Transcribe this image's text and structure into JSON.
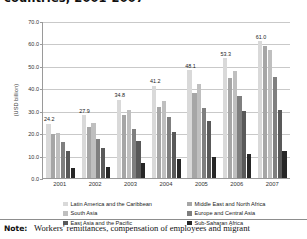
{
  "title": "countries, 2001-2007",
  "chart_data": {
    "type": "bar",
    "title": "countries, 2001-2007",
    "xlabel": "",
    "ylabel": "(USD billion)",
    "ylim": [
      0,
      70
    ],
    "ytick_step": 10,
    "yticks": [
      "0.0",
      "10.0",
      "20.0",
      "30.0",
      "40.0",
      "50.0",
      "60.0",
      "70.0"
    ],
    "grid": true,
    "legend_position": "bottom",
    "categories": [
      "2001",
      "2002",
      "2003",
      "2004",
      "2005",
      "2006",
      "2007"
    ],
    "series": [
      {
        "name": "Latin America and the Caribbean",
        "color": "#d9d9d9",
        "values": [
          24.2,
          27.9,
          34.8,
          41.2,
          48.1,
          53.3,
          61.0
        ],
        "labels": [
          "24.2",
          "27.9",
          "34.8",
          "41.2",
          "48.1",
          "53.3",
          "61.0"
        ]
      },
      {
        "name": "Middle East and North Africa",
        "color": "#a6a6a6",
        "values": [
          19.5,
          22.6,
          28.3,
          31.5,
          38.0,
          44.5,
          59.0
        ]
      },
      {
        "name": "South Asia",
        "color": "#bfbfbf",
        "values": [
          20.0,
          24.4,
          30.5,
          34.5,
          42.0,
          47.5,
          57.0
        ]
      },
      {
        "name": "Europe and Central Asia",
        "color": "#7f7f7f",
        "values": [
          16.0,
          17.6,
          22.0,
          27.0,
          31.0,
          36.5,
          45.0
        ]
      },
      {
        "name": "East Asia and the Pacific",
        "color": "#595959",
        "values": [
          12.0,
          13.5,
          16.5,
          20.5,
          25.5,
          30.0,
          30.5
        ]
      },
      {
        "name": "Sub-Saharan Africa",
        "color": "#262626",
        "values": [
          4.5,
          4.8,
          6.5,
          8.5,
          9.5,
          10.5,
          12.0
        ]
      }
    ]
  },
  "note": {
    "key": "Note:",
    "text": "Workers' remittances, compensation of employees and migrant"
  }
}
